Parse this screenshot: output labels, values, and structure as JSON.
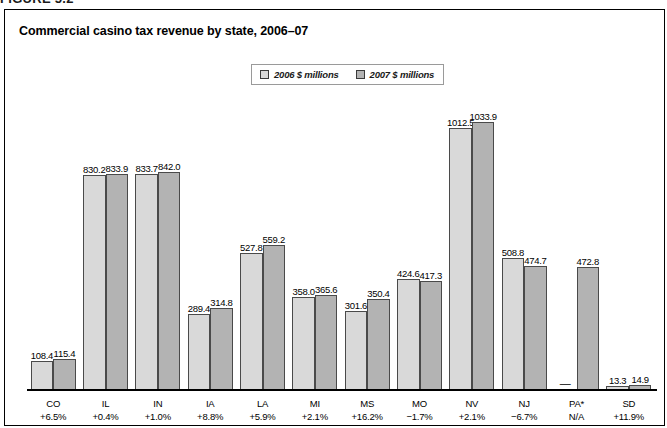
{
  "figure_caption": "FIGURE 5.2",
  "chart_title": "Commercial casino tax revenue by state, 2006–07",
  "legend": [
    {
      "label": "2006 $ millions",
      "color": "#d9d9d9",
      "swatch_name": "legend-swatch-2006"
    },
    {
      "label": "2007 $ millions",
      "color": "#b3b3b3",
      "swatch_name": "legend-swatch-2007"
    }
  ],
  "chart_data": {
    "type": "bar",
    "title": "Commercial casino tax revenue by state, 2006–07",
    "xlabel": "",
    "ylabel": "",
    "ylim": [
      0,
      1100
    ],
    "grid": false,
    "legend_position": "top-center",
    "categories": [
      "CO",
      "IL",
      "IN",
      "IA",
      "LA",
      "MI",
      "MS",
      "MO",
      "NV",
      "NJ",
      "PA*",
      "SD"
    ],
    "category_change": [
      "+6.5%",
      "+0.4%",
      "+1.0%",
      "+8.8%",
      "+5.9%",
      "+2.1%",
      "+16.2%",
      "−1.7%",
      "+2.1%",
      "−6.7%",
      "N/A",
      "+11.9%"
    ],
    "series": [
      {
        "name": "2006 $ millions",
        "color": "#d9d9d9",
        "values": [
          108.4,
          830.2,
          833.7,
          289.4,
          527.8,
          358.0,
          301.6,
          424.6,
          1012.5,
          508.8,
          null,
          13.3
        ],
        "labels": [
          "108.4",
          "830.2",
          "833.7",
          "289.4",
          "527.8",
          "358.0",
          "301.6",
          "424.6",
          "1012.5",
          "508.8",
          "—",
          "13.3"
        ]
      },
      {
        "name": "2007 $ millions",
        "color": "#b3b3b3",
        "values": [
          115.4,
          833.9,
          842.0,
          314.8,
          559.2,
          365.6,
          350.4,
          417.3,
          1033.9,
          474.7,
          472.8,
          14.9
        ],
        "labels": [
          "115.4",
          "833.9",
          "842.0",
          "314.8",
          "559.2",
          "365.6",
          "350.4",
          "417.3",
          "1033.9",
          "474.7",
          "472.8",
          "14.9"
        ]
      }
    ]
  }
}
